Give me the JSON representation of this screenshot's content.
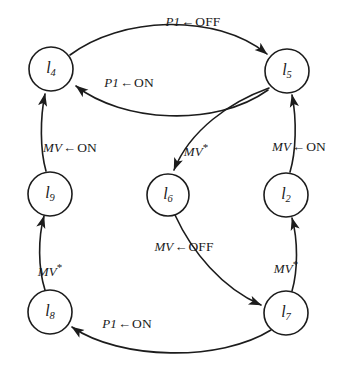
{
  "diagram": {
    "type": "state-transition-graph",
    "title": "",
    "background_color": "#ffffff",
    "stroke_color": "#1c1c1c",
    "nodes": [
      {
        "id": "l4",
        "base": "l",
        "subscript": "4",
        "label": "l4",
        "cx": 51,
        "cy": 69,
        "r": 22
      },
      {
        "id": "l5",
        "base": "l",
        "subscript": "5",
        "label": "l5",
        "cx": 287,
        "cy": 71,
        "r": 22
      },
      {
        "id": "l9",
        "base": "l",
        "subscript": "9",
        "label": "l9",
        "cx": 50,
        "cy": 194,
        "r": 22
      },
      {
        "id": "l6",
        "base": "l",
        "subscript": "6",
        "label": "l6",
        "cx": 168,
        "cy": 195,
        "r": 21
      },
      {
        "id": "l2",
        "base": "l",
        "subscript": "2",
        "label": "l2",
        "cx": 286,
        "cy": 195,
        "r": 22
      },
      {
        "id": "l8",
        "base": "l",
        "subscript": "8",
        "label": "l8",
        "cx": 50,
        "cy": 312,
        "r": 22
      },
      {
        "id": "l7",
        "base": "l",
        "subscript": "7",
        "label": "l7",
        "cx": 286,
        "cy": 313,
        "r": 22
      }
    ],
    "edges": [
      {
        "id": "e-l4-l5",
        "from": "l4",
        "to": "l5",
        "variable": "P1",
        "arrow": "←",
        "value": "OFF",
        "star": false,
        "label_x": 193,
        "label_y": 22
      },
      {
        "id": "e-l5-l4",
        "from": "l5",
        "to": "l4",
        "variable": "P1",
        "arrow": "←",
        "value": "ON",
        "star": false,
        "label_x": 129,
        "label_y": 83
      },
      {
        "id": "e-l9-l4",
        "from": "l9",
        "to": "l4",
        "variable": "MV",
        "arrow": "←",
        "value": "ON",
        "star": false,
        "label_x": 70,
        "label_y": 148
      },
      {
        "id": "e-l5-l6",
        "from": "l5",
        "to": "l6",
        "variable": "MV",
        "arrow": "",
        "value": "",
        "star": true,
        "label_x": 196,
        "label_y": 150
      },
      {
        "id": "e-l2-l5",
        "from": "l2",
        "to": "l5",
        "variable": "MV",
        "arrow": "←",
        "value": "ON",
        "star": false,
        "label_x": 299,
        "label_y": 147
      },
      {
        "id": "e-l6-l7",
        "from": "l6",
        "to": "l7",
        "variable": "MV",
        "arrow": "←",
        "value": "OFF",
        "star": false,
        "label_x": 184,
        "label_y": 247
      },
      {
        "id": "e-l8-l9",
        "from": "l8",
        "to": "l9",
        "variable": "MV",
        "arrow": "",
        "value": "",
        "star": true,
        "label_x": 50,
        "label_y": 270
      },
      {
        "id": "e-l7-l2",
        "from": "l7",
        "to": "l2",
        "variable": "MV",
        "arrow": "",
        "value": "",
        "star": true,
        "label_x": 286,
        "label_y": 267
      },
      {
        "id": "e-l7-l8",
        "from": "l7",
        "to": "l8",
        "variable": "P1",
        "arrow": "←",
        "value": "ON",
        "star": false,
        "label_x": 127,
        "label_y": 324
      }
    ]
  }
}
